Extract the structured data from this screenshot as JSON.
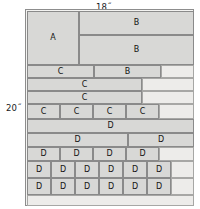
{
  "diagram": {
    "dimensions": {
      "top_label": "18˝",
      "left_label": "20˝"
    },
    "colors": {
      "part_fill": "#d8d8d6",
      "waste_fill": "#edecea",
      "stroke": "#8a8a8a",
      "sheet_fill": "#f3f3f1",
      "text": "#121212"
    },
    "sheet": {
      "x": 25,
      "y": 9,
      "width": 169,
      "height": 197
    },
    "parts": [
      {
        "label": "A",
        "x": 1,
        "y": 1,
        "w": 52,
        "h": 54,
        "waste": false
      },
      {
        "label": "B",
        "x": 53,
        "y": 1,
        "w": 115,
        "h": 24,
        "waste": false
      },
      {
        "label": "B",
        "x": 53,
        "y": 25,
        "w": 115,
        "h": 30,
        "waste": false
      },
      {
        "label": "",
        "x": 1,
        "y": 55,
        "w": 52,
        "h": 0,
        "waste": true
      },
      {
        "label": "C",
        "x": 1,
        "y": 55,
        "w": 67,
        "h": 13,
        "waste": false
      },
      {
        "label": "B",
        "x": 68,
        "y": 55,
        "w": 67,
        "h": 13,
        "waste": false
      },
      {
        "label": "",
        "x": 135,
        "y": 55,
        "w": 33,
        "h": 13,
        "waste": true
      },
      {
        "label": "C",
        "x": 1,
        "y": 68,
        "w": 115,
        "h": 13,
        "waste": false
      },
      {
        "label": "",
        "x": 116,
        "y": 68,
        "w": 52,
        "h": 13,
        "waste": true
      },
      {
        "label": "C",
        "x": 1,
        "y": 81,
        "w": 115,
        "h": 13,
        "waste": false
      },
      {
        "label": "",
        "x": 116,
        "y": 81,
        "w": 52,
        "h": 13,
        "waste": true
      },
      {
        "label": "C",
        "x": 1,
        "y": 94,
        "w": 33,
        "h": 15,
        "waste": false
      },
      {
        "label": "C",
        "x": 34,
        "y": 94,
        "w": 33,
        "h": 15,
        "waste": false
      },
      {
        "label": "C",
        "x": 67,
        "y": 94,
        "w": 33,
        "h": 15,
        "waste": false
      },
      {
        "label": "C",
        "x": 100,
        "y": 94,
        "w": 33,
        "h": 15,
        "waste": false
      },
      {
        "label": "",
        "x": 133,
        "y": 94,
        "w": 35,
        "h": 15,
        "waste": true
      },
      {
        "label": "D",
        "x": 1,
        "y": 109,
        "w": 167,
        "h": 14,
        "waste": false
      },
      {
        "label": "D",
        "x": 1,
        "y": 123,
        "w": 101,
        "h": 14,
        "waste": false
      },
      {
        "label": "D",
        "x": 102,
        "y": 123,
        "w": 66,
        "h": 14,
        "waste": false
      },
      {
        "label": "D",
        "x": 1,
        "y": 137,
        "w": 33,
        "h": 14,
        "waste": false
      },
      {
        "label": "D",
        "x": 34,
        "y": 137,
        "w": 33,
        "h": 14,
        "waste": false
      },
      {
        "label": "D",
        "x": 67,
        "y": 137,
        "w": 33,
        "h": 14,
        "waste": false
      },
      {
        "label": "D",
        "x": 100,
        "y": 137,
        "w": 33,
        "h": 14,
        "waste": false
      },
      {
        "label": "",
        "x": 133,
        "y": 137,
        "w": 35,
        "h": 14,
        "waste": true
      },
      {
        "label": "D",
        "x": 1,
        "y": 151,
        "w": 24,
        "h": 17,
        "waste": false
      },
      {
        "label": "D",
        "x": 25,
        "y": 151,
        "w": 24,
        "h": 17,
        "waste": false
      },
      {
        "label": "D",
        "x": 49,
        "y": 151,
        "w": 24,
        "h": 17,
        "waste": false
      },
      {
        "label": "D",
        "x": 73,
        "y": 151,
        "w": 24,
        "h": 17,
        "waste": false
      },
      {
        "label": "D",
        "x": 97,
        "y": 151,
        "w": 24,
        "h": 17,
        "waste": false
      },
      {
        "label": "D",
        "x": 121,
        "y": 151,
        "w": 24,
        "h": 17,
        "waste": false
      },
      {
        "label": "",
        "x": 145,
        "y": 151,
        "w": 23,
        "h": 17,
        "waste": true
      },
      {
        "label": "D",
        "x": 1,
        "y": 168,
        "w": 24,
        "h": 17,
        "waste": false
      },
      {
        "label": "D",
        "x": 25,
        "y": 168,
        "w": 24,
        "h": 17,
        "waste": false
      },
      {
        "label": "D",
        "x": 49,
        "y": 168,
        "w": 24,
        "h": 17,
        "waste": false
      },
      {
        "label": "D",
        "x": 73,
        "y": 168,
        "w": 24,
        "h": 17,
        "waste": false
      },
      {
        "label": "D",
        "x": 97,
        "y": 168,
        "w": 24,
        "h": 17,
        "waste": false
      },
      {
        "label": "D",
        "x": 121,
        "y": 168,
        "w": 24,
        "h": 17,
        "waste": false
      },
      {
        "label": "",
        "x": 145,
        "y": 168,
        "w": 23,
        "h": 17,
        "waste": true
      },
      {
        "label": "",
        "x": 1,
        "y": 185,
        "w": 167,
        "h": 11,
        "waste": true
      }
    ]
  }
}
